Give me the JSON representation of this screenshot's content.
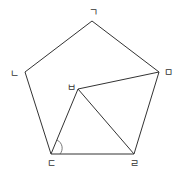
{
  "diagram": {
    "stroke_color": "#333333",
    "vertices": {
      "g": {
        "label": "ㄱ",
        "x": 92,
        "y": 21,
        "lx": 93,
        "ly": 16
      },
      "n": {
        "label": "ㄴ",
        "x": 25,
        "y": 72,
        "lx": 14,
        "ly": 77
      },
      "m": {
        "label": "ㅁ",
        "x": 159,
        "y": 72,
        "lx": 168,
        "ly": 76
      },
      "d": {
        "label": "ㄷ",
        "x": 51,
        "y": 154,
        "lx": 51,
        "ly": 167
      },
      "r": {
        "label": "ㄹ",
        "x": 134,
        "y": 154,
        "lx": 134,
        "ly": 167
      },
      "b": {
        "label": "ㅂ",
        "x": 78,
        "y": 89,
        "lx": 71,
        "ly": 91
      }
    },
    "labels": [
      "ㄱ",
      "ㄴ",
      "ㄷ",
      "ㄹ",
      "ㅁ",
      "ㅂ"
    ]
  }
}
